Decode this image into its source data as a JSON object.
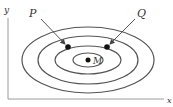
{
  "diagram": {
    "type": "contour-plot",
    "axes": {
      "x_label": "x",
      "y_label": "y",
      "color": "#888888"
    },
    "contours": {
      "center": [
        88,
        60
      ],
      "count": 4,
      "radii": [
        [
          66,
          33
        ],
        [
          50,
          24
        ],
        [
          33,
          14
        ],
        [
          15,
          7
        ]
      ],
      "color": "#555555"
    },
    "points": [
      {
        "id": "P",
        "label": "P",
        "x": 68,
        "y": 47
      },
      {
        "id": "Q",
        "label": "Q",
        "x": 107,
        "y": 47
      },
      {
        "id": "M",
        "label": "M",
        "x": 88,
        "y": 60
      }
    ],
    "arrows": [
      {
        "from": "P-label",
        "to": "P"
      },
      {
        "from": "Q-label",
        "to": "Q"
      }
    ]
  }
}
